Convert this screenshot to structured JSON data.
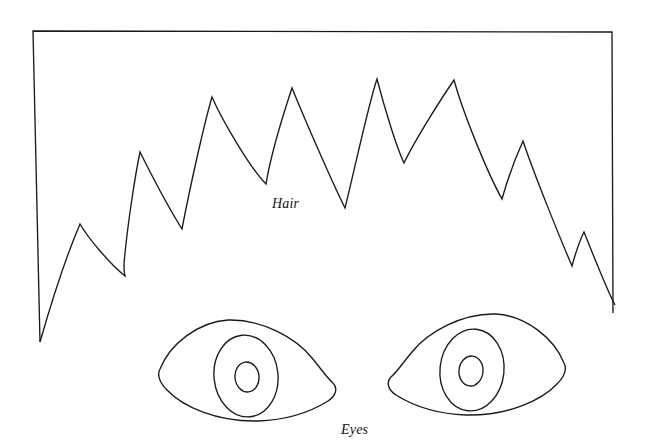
{
  "figure": {
    "background_color": "#ffffff",
    "ink_color": "#1a1a1a",
    "stroke_width": 1.35,
    "width": 645,
    "height": 446
  },
  "labels": {
    "hair": "Hair",
    "eyes": "Eyes"
  },
  "frame": {
    "name": "open-rectangle-border",
    "top_left": [
      33,
      31
    ],
    "top_right": [
      612,
      32
    ],
    "left_bottom": [
      40,
      342
    ],
    "right_bottom": [
      613,
      313
    ],
    "note": "Rectangle drawn with top, left and right sides only; the hair outline closes the bottom."
  },
  "hair_outline": {
    "name": "spiky-hair-silhouette",
    "points": [
      [
        40,
        342
      ],
      [
        80,
        224
      ],
      [
        125,
        275
      ],
      [
        124,
        266
      ],
      [
        140,
        152
      ],
      [
        182,
        229
      ],
      [
        212,
        97
      ],
      [
        266,
        184
      ],
      [
        292,
        88
      ],
      [
        345,
        208
      ],
      [
        377,
        79
      ],
      [
        404,
        163
      ],
      [
        454,
        80
      ],
      [
        502,
        199
      ],
      [
        523,
        141
      ],
      [
        572,
        266
      ],
      [
        584,
        232
      ],
      [
        615,
        305
      ]
    ]
  },
  "eyes": {
    "left_eye": {
      "name": "left-eye",
      "outline_center": [
        247,
        372
      ],
      "iris_center": [
        246,
        376
      ],
      "iris_radius": 32,
      "pupil_center": [
        247,
        377
      ],
      "pupil_radius": 12
    },
    "right_eye": {
      "name": "right-eye",
      "outline_center": [
        478,
        366
      ],
      "iris_center": [
        472,
        370
      ],
      "iris_radius": 32,
      "pupil_center": [
        471,
        371
      ],
      "pupil_radius": 12
    }
  }
}
